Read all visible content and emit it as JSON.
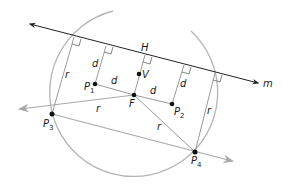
{
  "diagram": {
    "colors": {
      "directrix": "#222222",
      "circle": "#b0b0b0",
      "segments": "#999999",
      "points": "#111111",
      "rays": "#a8a8a8"
    },
    "labels": {
      "line": "m",
      "focus": "F",
      "vertex": "V",
      "foot": "H",
      "p1": "P",
      "p1_sub": "1",
      "p2": "P",
      "p2_sub": "2",
      "p3": "P",
      "p3_sub": "3",
      "p4": "P",
      "p4_sub": "4",
      "d1": "d",
      "d2": "d",
      "d3": "d",
      "d4": "d",
      "r1": "r",
      "r2": "r",
      "r3": "r",
      "r4": "r"
    },
    "points": {
      "F": [
        134,
        95
      ],
      "V": [
        139,
        74
      ],
      "P1": [
        95,
        84
      ],
      "P2": [
        172,
        104
      ],
      "P3": [
        52,
        114
      ],
      "P4": [
        195,
        152
      ],
      "H": [
        145,
        55
      ]
    }
  }
}
